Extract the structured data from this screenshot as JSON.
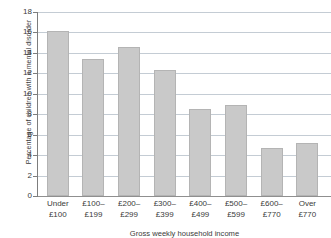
{
  "chart_data": {
    "type": "bar",
    "title": "",
    "xlabel": "Gross weekly household income",
    "ylabel": "Percentage of children with a mental disorder",
    "categories": [
      "Under £100",
      "£100–£199",
      "£200–£299",
      "£300–£399",
      "£400–£499",
      "£500–£599",
      "£600–£770",
      "Over £770"
    ],
    "category_lines": [
      [
        "Under",
        "£100"
      ],
      [
        "£100–",
        "£199"
      ],
      [
        "£200–",
        "£299"
      ],
      [
        "£300–",
        "£399"
      ],
      [
        "£400–",
        "£499"
      ],
      [
        "£500–",
        "£599"
      ],
      [
        "£600–",
        "£770"
      ],
      [
        "Over",
        "£770"
      ]
    ],
    "values": [
      16.1,
      13.4,
      14.6,
      12.3,
      8.5,
      8.9,
      4.7,
      5.2
    ],
    "ylim": [
      0,
      18
    ],
    "ytick_step": 2,
    "yticks": [
      0,
      2,
      4,
      6,
      8,
      10,
      12,
      14,
      16,
      18
    ],
    "ytick_labels": [
      "0",
      "2",
      "4",
      "6",
      "8",
      "10",
      "12",
      "14",
      "16",
      "18"
    ],
    "grid": true,
    "grid_axis": "y",
    "legend": false,
    "legend_position": "none",
    "bar_color": "#c9c9c9",
    "bar_edge_color": "#b4b4b4",
    "gridline_color": "#c4ccd4",
    "axis_color": "#7d7d7d",
    "text_color": "#3b3b3b",
    "background_color": "#ffffff"
  }
}
